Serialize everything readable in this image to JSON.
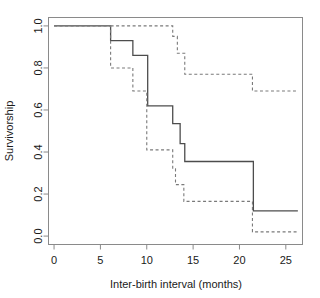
{
  "figure": {
    "background_color": "#ffffff",
    "frame_color": "#8a8a8a",
    "text_color": "#1a1a1a"
  },
  "chart_data": {
    "type": "line",
    "title": "",
    "subtitle": "",
    "xlabel": "Inter-birth interval (months)",
    "ylabel": "Survivorship",
    "xlim": [
      -0.6,
      26.8
    ],
    "ylim": [
      -0.04,
      1.04
    ],
    "xticks": [
      0,
      5,
      10,
      15,
      20,
      25
    ],
    "xtick_labels": [
      "0",
      "5",
      "10",
      "15",
      "20",
      "25"
    ],
    "yticks": [
      0.0,
      0.2,
      0.4,
      0.6,
      0.8,
      1.0
    ],
    "ytick_labels": [
      "0.0",
      "0.2",
      "0.4",
      "0.6",
      "0.8",
      "1.0"
    ],
    "grid": false,
    "legend": null,
    "legend_position": "none",
    "box_frame": true,
    "step_type": "post",
    "series": [
      {
        "name": "solid-curve",
        "style": "solid",
        "color": "#4d4d4d",
        "line_width": 1.3,
        "x": [
          0.0,
          6.1,
          8.5,
          10.1,
          12.8,
          13.6,
          14.1,
          20.8,
          21.5,
          26.3
        ],
        "y": [
          1.0,
          0.93,
          0.86,
          0.62,
          0.535,
          0.44,
          0.355,
          0.355,
          0.12,
          0.12
        ]
      },
      {
        "name": "dashed-curve",
        "style": "dashed",
        "color": "#7a7a7a",
        "line_width": 1.1,
        "dash_pattern": "3,2.5",
        "x": [
          0.0,
          6.1,
          8.5,
          10.0,
          10.3,
          12.8,
          13.1,
          14.0,
          14.2,
          20.7,
          21.4,
          26.3
        ],
        "y": [
          1.0,
          0.8,
          0.69,
          0.41,
          0.41,
          0.32,
          0.245,
          0.165,
          0.165,
          0.165,
          0.02,
          0.02
        ]
      },
      {
        "name": "dashed-upper-curve",
        "style": "dashed",
        "color": "#7a7a7a",
        "line_width": 1.1,
        "dash_pattern": "3,2.5",
        "x": [
          6.1,
          10.0,
          12.8,
          13.3,
          14.1,
          20.7,
          21.4,
          26.3
        ],
        "y": [
          1.0,
          1.0,
          0.95,
          0.87,
          0.77,
          0.77,
          0.69,
          0.69
        ]
      }
    ]
  }
}
